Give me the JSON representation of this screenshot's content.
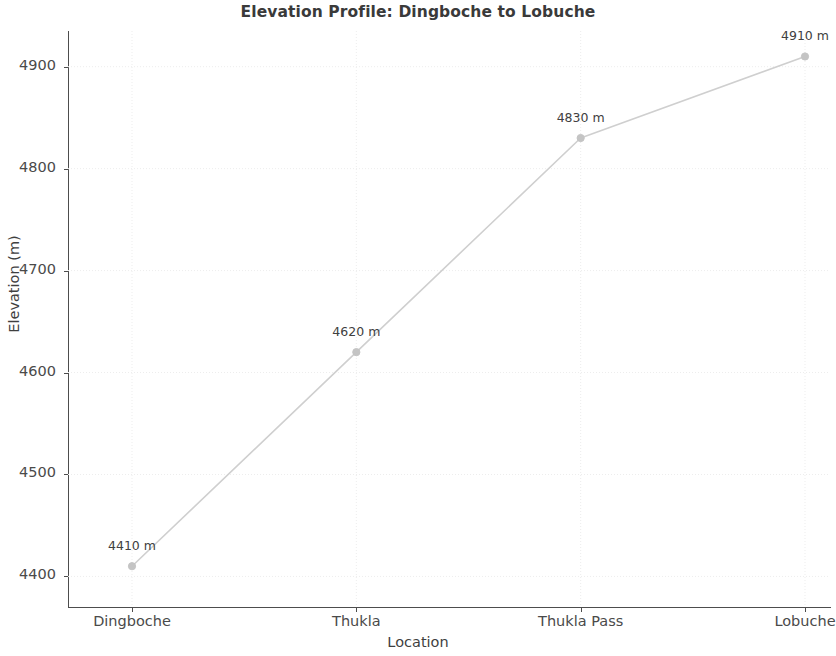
{
  "chart_data": {
    "type": "line",
    "title": "Elevation Profile: Dingboche to Lobuche",
    "xlabel": "Location",
    "ylabel": "Elevation (m)",
    "categories": [
      "Dingboche",
      "Thukla",
      "Thukla Pass",
      "Lobuche"
    ],
    "values": [
      4410,
      4620,
      4830,
      4910
    ],
    "point_labels": [
      "4410 m",
      "4620 m",
      "4830 m",
      "4910 m"
    ],
    "ylim": [
      4370,
      4935
    ],
    "yticks": [
      4400,
      4500,
      4600,
      4700,
      4800,
      4900
    ],
    "ytick_labels": [
      "4400",
      "4500",
      "4600",
      "4700",
      "4800",
      "4900"
    ],
    "xtick_labels": [
      "Dingboche",
      "Thukla",
      "Thukla Pass",
      "Lobuche"
    ],
    "grid": true,
    "grid_style": "dotted",
    "legend": null,
    "series": [
      {
        "name": "Elevation",
        "values": [
          4410,
          4620,
          4830,
          4910
        ],
        "line_color": "#cfcfcf",
        "marker": "circle",
        "marker_color": "#c4c4c4"
      }
    ],
    "colors": {
      "line": "#cfcfcf",
      "marker": "#c4c4c4",
      "grid": "#ededed",
      "axis": "#4d4d4d",
      "title_text": "#3a3a3a",
      "tick_text": "#4a4a4a",
      "annotation_text": "#404040",
      "background": "#ffffff"
    }
  }
}
